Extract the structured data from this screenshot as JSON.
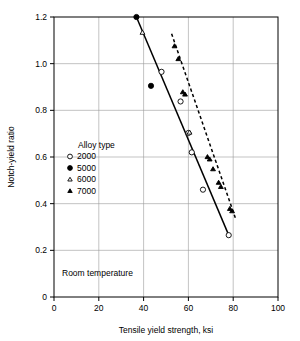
{
  "chart_data": {
    "type": "scatter",
    "title": "",
    "xlabel": "Tensile yield strength, ksi",
    "ylabel": "Notch-yield ratio",
    "xlim": [
      0,
      100
    ],
    "ylim": [
      0,
      1.2
    ],
    "xticks": [
      "0",
      "20",
      "40",
      "60",
      "80",
      "100"
    ],
    "yticks": [
      "0",
      "0.2",
      "0.4",
      "0.6",
      "0.8",
      "1.0",
      "1.2"
    ],
    "xtick_values": [
      0,
      20,
      40,
      60,
      80,
      100
    ],
    "ytick_values": [
      0,
      0.2,
      0.4,
      0.6,
      0.8,
      1.0,
      1.2
    ],
    "grid": true,
    "legend_position": "inside-left",
    "legend_title": "Alloy type",
    "annotation": "Room temperature",
    "series": [
      {
        "name": "2000",
        "marker": "open-circle",
        "points": [
          {
            "x": 48.0,
            "y": 0.965
          },
          {
            "x": 56.5,
            "y": 0.838
          },
          {
            "x": 60.0,
            "y": 0.703
          },
          {
            "x": 61.5,
            "y": 0.62
          },
          {
            "x": 66.5,
            "y": 0.46
          },
          {
            "x": 78.0,
            "y": 0.265
          }
        ]
      },
      {
        "name": "5000",
        "marker": "filled-circle",
        "points": [
          {
            "x": 36.8,
            "y": 1.2
          },
          {
            "x": 43.3,
            "y": 0.905
          }
        ]
      },
      {
        "name": "6000",
        "marker": "open-triangle",
        "points": [
          {
            "x": 39.5,
            "y": 1.133
          },
          {
            "x": 60.5,
            "y": 0.705
          }
        ]
      },
      {
        "name": "7000",
        "marker": "filled-triangle",
        "points": [
          {
            "x": 53.8,
            "y": 1.075
          },
          {
            "x": 55.5,
            "y": 1.02
          },
          {
            "x": 57.5,
            "y": 0.878
          },
          {
            "x": 58.5,
            "y": 0.868
          },
          {
            "x": 68.5,
            "y": 0.6
          },
          {
            "x": 69.5,
            "y": 0.59
          },
          {
            "x": 71.0,
            "y": 0.548
          },
          {
            "x": 73.5,
            "y": 0.49
          },
          {
            "x": 74.5,
            "y": 0.472
          },
          {
            "x": 78.5,
            "y": 0.378
          },
          {
            "x": 79.5,
            "y": 0.368
          }
        ]
      }
    ],
    "trend_lines": [
      {
        "name": "solid-trend",
        "style": "solid",
        "x1": 36.8,
        "y1": 1.2,
        "x2": 78.0,
        "y2": 0.265
      },
      {
        "name": "dashed-trend",
        "style": "dashed",
        "x1": 52.5,
        "y1": 1.128,
        "x2": 81.0,
        "y2": 0.338
      }
    ]
  },
  "legend": {
    "title": "Alloy type",
    "items": [
      {
        "label": "2000",
        "marker": "open-circle"
      },
      {
        "label": "5000",
        "marker": "filled-circle"
      },
      {
        "label": "6000",
        "marker": "open-triangle"
      },
      {
        "label": "7000",
        "marker": "filled-triangle"
      }
    ]
  }
}
